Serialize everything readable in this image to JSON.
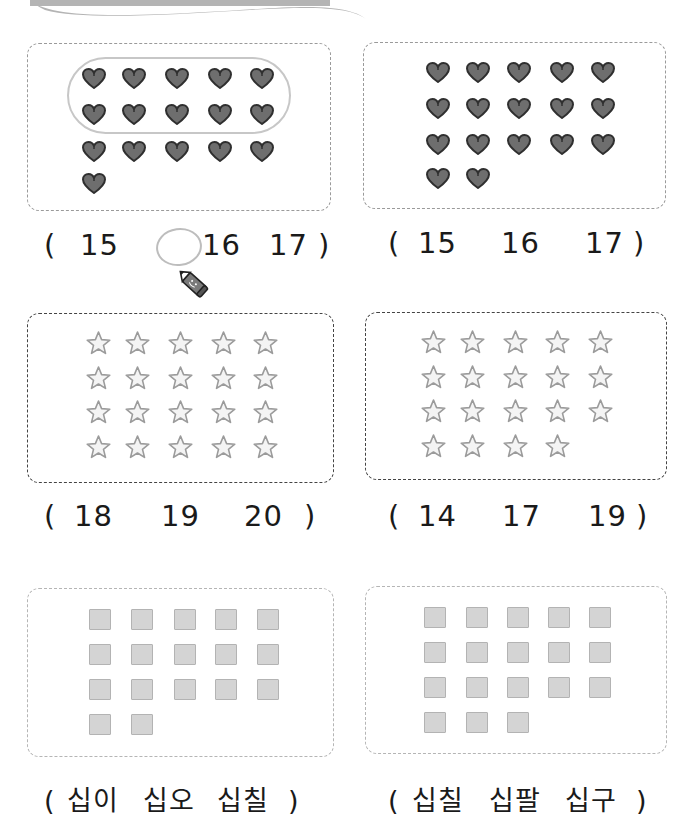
{
  "banner": {
    "icon": "swoosh-banner"
  },
  "problems": [
    {
      "id": 1,
      "item_type": "heart",
      "count": 16,
      "grouped_ten": true,
      "choices": [
        "15",
        "16",
        "17"
      ],
      "selected": "16",
      "open_paren": "(",
      "close_paren": ")"
    },
    {
      "id": 2,
      "item_type": "heart",
      "count": 17,
      "grouped_ten": false,
      "choices": [
        "15",
        "16",
        "17"
      ],
      "selected": null,
      "open_paren": "(",
      "close_paren": ")"
    },
    {
      "id": 3,
      "item_type": "star",
      "count": 20,
      "choices": [
        "18",
        "19",
        "20"
      ],
      "selected": null,
      "open_paren": "(",
      "close_paren": ")"
    },
    {
      "id": 4,
      "item_type": "star",
      "count": 19,
      "choices": [
        "14",
        "17",
        "19"
      ],
      "selected": null,
      "open_paren": "(",
      "close_paren": ")"
    },
    {
      "id": 5,
      "item_type": "square",
      "count": 17,
      "choices": [
        "십이",
        "십오",
        "십칠"
      ],
      "selected": null,
      "open_paren": "(",
      "close_paren": ")"
    },
    {
      "id": 6,
      "item_type": "square",
      "count": 18,
      "choices": [
        "십칠",
        "십팔",
        "십구"
      ],
      "selected": null,
      "open_paren": "(",
      "close_paren": ")"
    }
  ],
  "colors": {
    "heart_fill": "#6e6e6e",
    "heart_stroke": "#2f2f2f",
    "star_fill": "#f4f4f4",
    "star_stroke": "#9b9b9b",
    "square_fill": "#d4d4d4",
    "square_stroke": "#b3b3b3",
    "banner": "#b4b4b4",
    "marker_circle": "#bdbdbd"
  },
  "example_marker": {
    "icon": "pencil-icon"
  }
}
